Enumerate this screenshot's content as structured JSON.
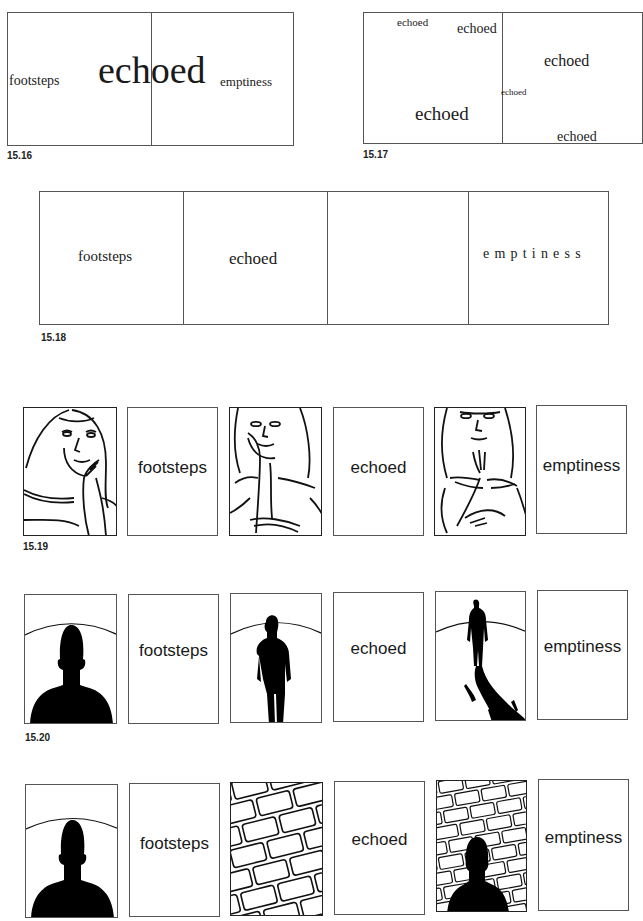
{
  "figures": {
    "fig_15_16": {
      "caption": "15.16",
      "words": [
        "footsteps",
        "echoed",
        "emptiness"
      ]
    },
    "fig_15_17": {
      "caption": "15.17",
      "words": [
        "echoed",
        "echoed",
        "echoed",
        "echoed",
        "echoed",
        "echoed"
      ]
    },
    "fig_15_18": {
      "caption": "15.18",
      "panels": [
        "footsteps",
        "echoed",
        "",
        "emptiness"
      ]
    },
    "fig_15_19": {
      "caption": "15.19",
      "panels": [
        {
          "type": "image",
          "icon": "woman-hand-on-cheek-drawing"
        },
        {
          "type": "text",
          "label": "footsteps"
        },
        {
          "type": "image",
          "icon": "woman-chin-on-hand-drawing"
        },
        {
          "type": "text",
          "label": "echoed"
        },
        {
          "type": "image",
          "icon": "woman-hand-to-chin-drawing"
        },
        {
          "type": "text",
          "label": "emptiness"
        }
      ]
    },
    "fig_15_20": {
      "caption": "15.20",
      "panels": [
        {
          "type": "image",
          "icon": "head-silhouette-arch"
        },
        {
          "type": "text",
          "label": "footsteps"
        },
        {
          "type": "image",
          "icon": "walking-figure-silhouette"
        },
        {
          "type": "text",
          "label": "echoed"
        },
        {
          "type": "image",
          "icon": "distant-figure-long-shadow"
        },
        {
          "type": "text",
          "label": "emptiness"
        }
      ]
    },
    "fig_15_21": {
      "panels": [
        {
          "type": "image",
          "icon": "head-silhouette-arch"
        },
        {
          "type": "text",
          "label": "footsteps"
        },
        {
          "type": "image",
          "icon": "brick-wall"
        },
        {
          "type": "text",
          "label": "echoed"
        },
        {
          "type": "image",
          "icon": "silhouette-against-brick-wall"
        },
        {
          "type": "text",
          "label": "emptiness"
        }
      ]
    }
  }
}
